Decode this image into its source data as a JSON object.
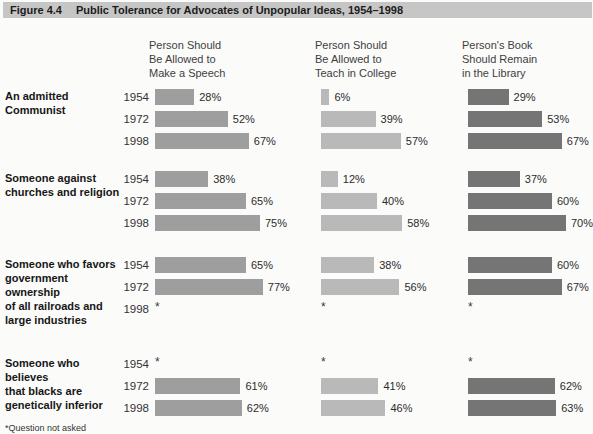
{
  "figure": {
    "label": "Figure 4.4",
    "title": "Public Tolerance for Advocates of Unpopular Ideas, 1954–1998",
    "footnote": "*Question not asked"
  },
  "chart_data": {
    "type": "bar",
    "title": "Public Tolerance for Advocates of Unpopular Ideas, 1954–1998",
    "orientation": "horizontal",
    "unit": "%",
    "value_suffix": "%",
    "missing_marker": "*",
    "missing_meaning": "Question not asked",
    "years": [
      "1954",
      "1972",
      "1998"
    ],
    "columns": [
      {
        "key": "speech",
        "header": [
          "Person Should",
          "Be Allowed to",
          "Make a Speech"
        ],
        "color": "#9e9e9e"
      },
      {
        "key": "college",
        "header": [
          "Person Should",
          "Be Allowed to",
          "Teach in College"
        ],
        "color": "#b9b9b9"
      },
      {
        "key": "library",
        "header": [
          "Person's Book",
          "Should Remain",
          "in the Library"
        ],
        "color": "#757575"
      }
    ],
    "groups": [
      {
        "label_lines": [
          "An admitted Communist"
        ],
        "series": {
          "speech": [
            28,
            52,
            67
          ],
          "college": [
            6,
            39,
            57
          ],
          "library": [
            29,
            53,
            67
          ]
        }
      },
      {
        "label_lines": [
          "Someone against",
          "churches and religion"
        ],
        "series": {
          "speech": [
            38,
            65,
            75
          ],
          "college": [
            12,
            40,
            58
          ],
          "library": [
            37,
            60,
            70
          ]
        }
      },
      {
        "label_lines": [
          "Someone who favors",
          "government ownership",
          "of all railroads and",
          "large industries"
        ],
        "series": {
          "speech": [
            65,
            77,
            null
          ],
          "college": [
            38,
            56,
            null
          ],
          "library": [
            60,
            67,
            null
          ]
        }
      },
      {
        "label_lines": [
          "Someone who believes",
          "that blacks are",
          "genetically inferior"
        ],
        "series": {
          "speech": [
            null,
            61,
            62
          ],
          "college": [
            null,
            41,
            46
          ],
          "library": [
            null,
            62,
            63
          ]
        }
      }
    ]
  }
}
